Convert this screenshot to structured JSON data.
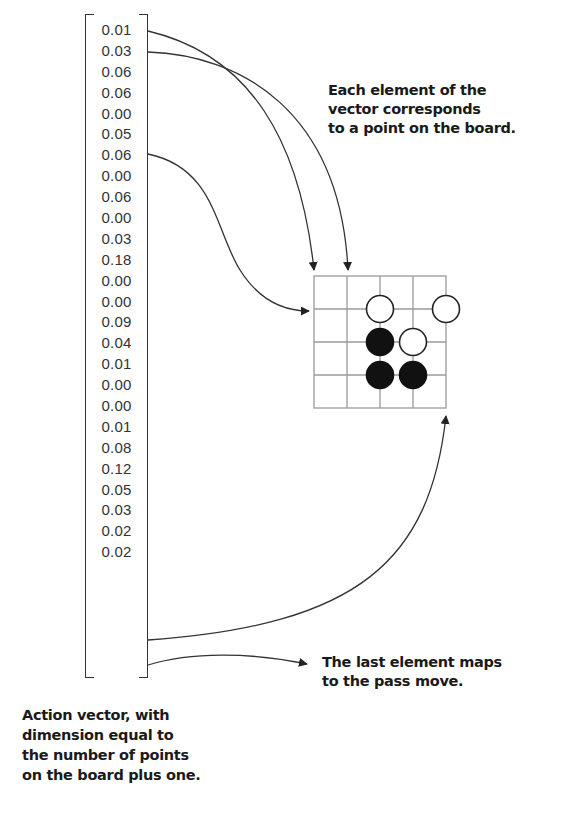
{
  "vector": {
    "name": "Action vector",
    "values": [
      "0.01",
      "0.03",
      "0.06",
      "0.06",
      "0.00",
      "0.05",
      "0.06",
      "0.00",
      "0.06",
      "0.00",
      "0.03",
      "0.18",
      "0.00",
      "0.00",
      "0.09",
      "0.04",
      "0.01",
      "0.00",
      "0.00",
      "0.01",
      "0.08",
      "0.12",
      "0.05",
      "0.03",
      "0.02",
      "0.02"
    ]
  },
  "annotations": {
    "board_mapping": [
      "Each element of the",
      "vector corresponds",
      "to a point on the board."
    ],
    "pass_move": [
      "The last element maps",
      "to the pass move."
    ],
    "vector_caption": [
      "Action vector, with",
      "dimension equal to",
      "the number of points",
      "on the board plus one."
    ]
  },
  "board": {
    "size": 5,
    "stones": [
      {
        "row": 1,
        "col": 2,
        "color": "white"
      },
      {
        "row": 1,
        "col": 4,
        "color": "white"
      },
      {
        "row": 2,
        "col": 2,
        "color": "black"
      },
      {
        "row": 2,
        "col": 3,
        "color": "white"
      },
      {
        "row": 3,
        "col": 2,
        "color": "black"
      },
      {
        "row": 3,
        "col": 3,
        "color": "black"
      }
    ]
  },
  "colors": {
    "line": "#333333",
    "grid": "#9a9a9a",
    "black_stone": "#111111",
    "white_stone": "#ffffff",
    "text": "#1a1a1a"
  }
}
